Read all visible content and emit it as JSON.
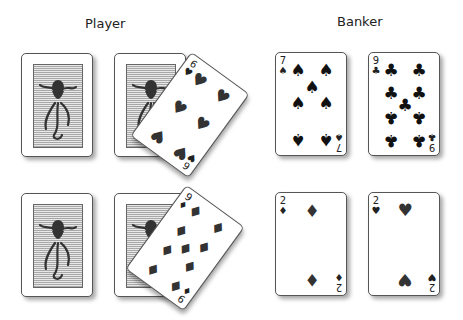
{
  "labels": {
    "player": "Player",
    "banker": "Banker"
  },
  "player": {
    "hand1": {
      "backs": [
        "octopus-back",
        "octopus-back"
      ],
      "drawn": {
        "rank": "6",
        "suit": "hearts",
        "symbol": "♥"
      }
    },
    "hand2": {
      "backs": [
        "octopus-back",
        "octopus-back"
      ],
      "drawn": {
        "rank": "9",
        "suit": "diamonds",
        "symbol": "♦"
      }
    }
  },
  "banker": {
    "top": [
      {
        "rank": "7",
        "suit": "spades",
        "symbol": "♠"
      },
      {
        "rank": "9",
        "suit": "clubs",
        "symbol": "♣"
      }
    ],
    "bottom": [
      {
        "rank": "2",
        "suit": "diamonds",
        "symbol": "♦"
      },
      {
        "rank": "2",
        "suit": "hearts",
        "symbol": "♥"
      }
    ]
  }
}
